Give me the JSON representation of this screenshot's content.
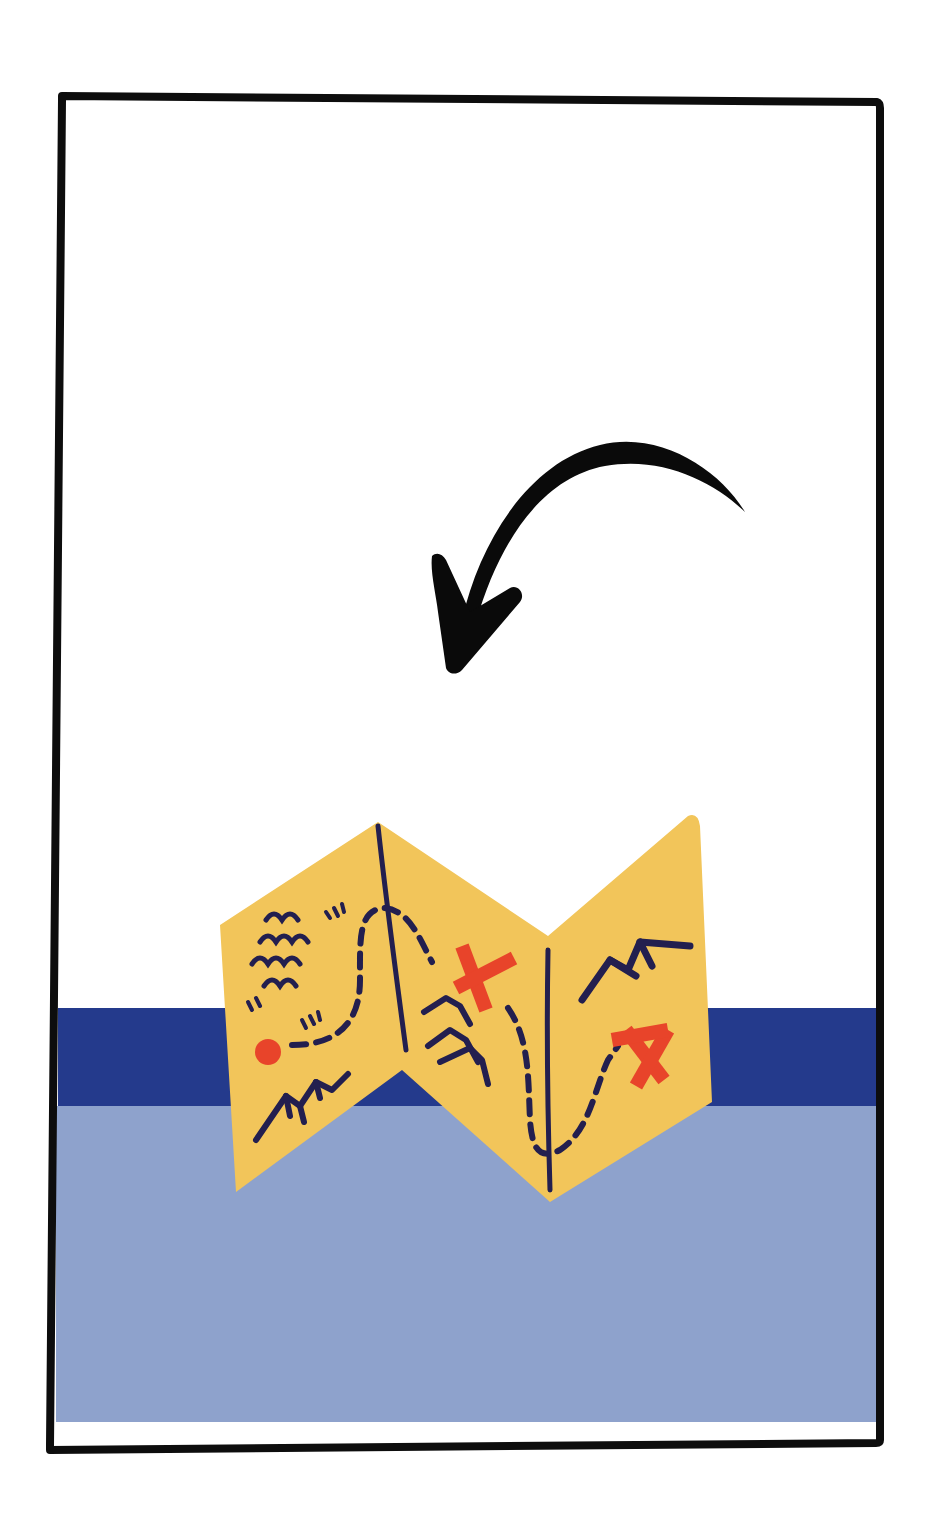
{
  "illustration": {
    "subject": "folded treasure map",
    "caption": "",
    "colors": {
      "background": "#ffffff",
      "frame": "#0d0d0d",
      "paper": "#f2c55a",
      "ink": "#231f4f",
      "marker": "#e8442a",
      "band_dark": "#243a8c",
      "band_light": "#8ea2cc",
      "arrow": "#0a0a0a"
    },
    "elements": {
      "arrow": "curved-arrow pointing down-left",
      "map_panels": 4,
      "x_marks": 2,
      "start_dot": 1,
      "mountains": 3,
      "waves": 1
    }
  }
}
